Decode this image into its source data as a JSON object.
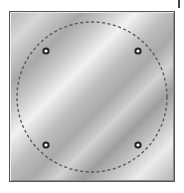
{
  "image": {
    "description": "metal-square-plate-with-dashed-circle-and-four-holes",
    "plate": {
      "x": 9,
      "y": 11,
      "width": 166,
      "height": 171,
      "border_color": "#555555"
    },
    "guide_circle": {
      "cx": 92,
      "cy": 97,
      "r": 75,
      "style": "dashed",
      "color": "#555555"
    },
    "holes": [
      {
        "name": "top-left",
        "cx": 46,
        "cy": 51
      },
      {
        "name": "top-right",
        "cx": 138,
        "cy": 51
      },
      {
        "name": "bottom-left",
        "cx": 46,
        "cy": 145
      },
      {
        "name": "bottom-right",
        "cx": 138,
        "cy": 145
      }
    ],
    "colors": {
      "hole_ring": "#222222",
      "hole_center": "#ffffff",
      "background": "#ffffff"
    }
  }
}
